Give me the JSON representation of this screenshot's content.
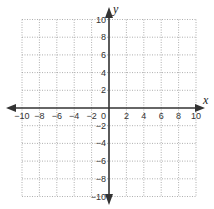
{
  "chart_data": {
    "type": "scatter",
    "title": "",
    "xlabel": "x",
    "ylabel": "y",
    "xlim": [
      -10,
      10
    ],
    "ylim": [
      -10,
      10
    ],
    "grid": true,
    "grid_style": "dotted",
    "grid_step": 2,
    "x_ticks": [
      -10,
      -8,
      -6,
      -4,
      -2,
      0,
      2,
      4,
      6,
      8,
      10
    ],
    "y_ticks": [
      -10,
      -8,
      -6,
      -4,
      -2,
      2,
      4,
      6,
      8,
      10
    ],
    "x_tick_labels": [
      "−10",
      "−8",
      "−6",
      "−4",
      "−2",
      "0",
      "2",
      "4",
      "6",
      "8",
      "10"
    ],
    "y_tick_labels": [
      "10",
      "8",
      "6",
      "4",
      "2",
      "−2",
      "−4",
      "−6",
      "−8",
      "−10"
    ],
    "series": [],
    "legend": null
  },
  "colors": {
    "axis": "#333333",
    "grid": "#9a9a9a",
    "background": "#ffffff"
  }
}
